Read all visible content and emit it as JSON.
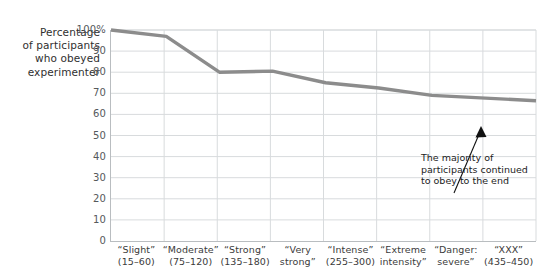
{
  "chart_data": {
    "type": "line",
    "title": "",
    "xlabel": "",
    "ylabel": "Percentage of participants who obeyed experimenter",
    "ylim": [
      0,
      100
    ],
    "grid": true,
    "legend": false,
    "y_ticks": [
      "100%",
      "90",
      "80",
      "70",
      "60",
      "50",
      "40",
      "30",
      "20",
      "10",
      "0"
    ],
    "y_tick_values": [
      100,
      90,
      80,
      70,
      60,
      50,
      40,
      30,
      20,
      10,
      0
    ],
    "categories": [
      "“Slight” (15–60)",
      "“Moderate” (75–120)",
      "“Strong” (135–180)",
      "“Very strong”",
      "“Intense” (255–300)",
      "“Extreme intensity”",
      "“Danger: severe”",
      "“XXX” (435–450)"
    ],
    "values": [
      100,
      97,
      80,
      80.5,
      75,
      72.5,
      69,
      66.5
    ],
    "series": [
      {
        "name": "Percentage who obeyed",
        "values": [
          100,
          97,
          80,
          80.5,
          75,
          72.5,
          69,
          66.5
        ],
        "color": "#8c8c8c"
      }
    ],
    "annotations": [
      {
        "text": "The majority of participants continued to obey to the end",
        "lines": [
          "The majority of",
          "participants continued",
          "to obey to the end"
        ],
        "arrow": "up-right"
      }
    ]
  },
  "y_axis": {
    "title_lines": [
      "Percentage",
      "of participants",
      "who obeyed",
      "experimenter"
    ],
    "ticks": [
      {
        "label": "100%",
        "value": 100
      },
      {
        "label": "90",
        "value": 90
      },
      {
        "label": "80",
        "value": 80
      },
      {
        "label": "70",
        "value": 70
      },
      {
        "label": "60",
        "value": 60
      },
      {
        "label": "50",
        "value": 50
      },
      {
        "label": "40",
        "value": 40
      },
      {
        "label": "30",
        "value": 30
      },
      {
        "label": "20",
        "value": 20
      },
      {
        "label": "10",
        "value": 10
      },
      {
        "label": "0",
        "value": 0
      }
    ]
  },
  "x_axis": {
    "labels": [
      {
        "line1": "“Slight”",
        "line2": "(15–60)"
      },
      {
        "line1": "“Moderate”",
        "line2": "(75–120)"
      },
      {
        "line1": "“Strong”",
        "line2": "(135–180)"
      },
      {
        "line1": "“Very",
        "line2": "strong”"
      },
      {
        "line1": "“Intense”",
        "line2": "(255–300)"
      },
      {
        "line1": "“Extreme",
        "line2": "intensity”"
      },
      {
        "line1": "“Danger:",
        "line2": "severe”"
      },
      {
        "line1": "“XXX”",
        "line2": "(435–450)"
      }
    ]
  },
  "annotation": {
    "line1": "The majority of",
    "line2": "participants continued",
    "line3": "to obey to the end"
  },
  "colors": {
    "line": "#8c8c8c",
    "grid": "#d8dbdd",
    "axis": "#b9bdc0",
    "text": "#3b3b3b",
    "tick_text": "#55595c",
    "annotation": "#1c1c1c",
    "background": "#ffffff"
  }
}
